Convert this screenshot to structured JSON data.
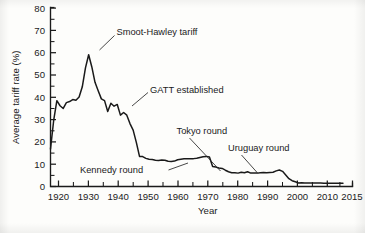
{
  "chart_data": {
    "type": "line",
    "title": "",
    "xlabel": "Year",
    "ylabel": "Average tariff rate (%)",
    "xlim": [
      1920,
      2015
    ],
    "ylim": [
      0,
      80
    ],
    "grid": false,
    "legend": "none",
    "x_ticks": [
      1920,
      1930,
      1940,
      1950,
      1960,
      1970,
      1980,
      1990,
      2000,
      2010,
      2015
    ],
    "x_tick_labels": [
      "1920",
      "1930",
      "1940",
      "1950",
      "1960",
      "1970",
      "1980",
      "1990",
      "2000",
      "2010",
      "2015"
    ],
    "x_minor_ticks": [
      1925,
      1935,
      1945,
      1955,
      1965,
      1975,
      1985,
      1995,
      2005
    ],
    "y_ticks": [
      0,
      10,
      20,
      30,
      40,
      50,
      60,
      70,
      80
    ],
    "y_tick_labels": [
      "0",
      "10",
      "20",
      "30",
      "40",
      "50",
      "60",
      "70",
      "80"
    ],
    "y_minor_ticks": [
      5,
      15,
      25,
      35,
      45,
      55,
      65,
      75
    ],
    "series": [
      {
        "name": "Average tariff rate",
        "units": "%",
        "x": [
          1920,
          1921,
          1922,
          1923,
          1924,
          1925,
          1926,
          1927,
          1928,
          1929,
          1930,
          1931,
          1932,
          1933,
          1934,
          1935,
          1936,
          1937,
          1938,
          1939,
          1940,
          1941,
          1942,
          1943,
          1944,
          1945,
          1946,
          1947,
          1948,
          1949,
          1950,
          1951,
          1952,
          1953,
          1954,
          1955,
          1956,
          1957,
          1958,
          1959,
          1960,
          1961,
          1962,
          1963,
          1964,
          1965,
          1966,
          1967,
          1968,
          1969,
          1970,
          1971,
          1972,
          1973,
          1974,
          1975,
          1976,
          1977,
          1978,
          1979,
          1980,
          1981,
          1982,
          1983,
          1984,
          1985,
          1986,
          1987,
          1988,
          1989,
          1990,
          1991,
          1992,
          1993,
          1994,
          1995,
          1996,
          1997,
          1998,
          1999,
          2000,
          2001,
          2002,
          2003,
          2004,
          2005,
          2006,
          2007,
          2008,
          2009,
          2010,
          2011,
          2012
        ],
        "y": [
          16.8,
          29.6,
          38.5,
          36.2,
          35.0,
          37.6,
          38.1,
          39.0,
          38.7,
          40.1,
          44.7,
          53.2,
          59.1,
          53.6,
          46.7,
          42.9,
          39.3,
          38.5,
          33.6,
          37.3,
          36.0,
          36.8,
          32.0,
          33.2,
          32.0,
          28.2,
          25.3,
          19.8,
          13.5,
          13.4,
          12.6,
          12.2,
          12.1,
          11.8,
          11.7,
          11.9,
          11.8,
          11.3,
          11.2,
          11.4,
          12.0,
          12.2,
          12.4,
          12.4,
          12.5,
          12.5,
          12.7,
          13.0,
          13.3,
          13.5,
          13.2,
          9.0,
          8.7,
          8.3,
          8.1,
          7.3,
          6.6,
          6.2,
          6.2,
          6.0,
          6.4,
          6.2,
          6.6,
          6.0,
          6.1,
          6.0,
          6.2,
          6.3,
          6.2,
          6.3,
          6.4,
          7.0,
          7.4,
          6.8,
          5.2,
          3.5,
          2.6,
          2.1,
          1.6,
          1.7,
          1.6,
          1.6,
          1.6,
          1.6,
          1.6,
          1.6,
          1.5,
          1.5,
          1.5,
          1.5,
          1.5,
          1.5,
          1.5
        ]
      }
    ],
    "annotations": [
      {
        "id": "smoot-hawley",
        "label": "Smoot-Hawley tariff",
        "points_to_year": 1932,
        "points_to_value": 58
      },
      {
        "id": "gatt",
        "label": "GATT established",
        "points_to_year": 1947,
        "points_to_value": 32
      },
      {
        "id": "kennedy-round",
        "label": "Kennedy round",
        "points_to_year": 1967,
        "points_to_value": 13
      },
      {
        "id": "tokyo-round",
        "label": "Tokyo round",
        "points_to_year": 1979,
        "points_to_value": 6
      },
      {
        "id": "uruguay-round",
        "label": "Uruguay round",
        "points_to_year": 1994,
        "points_to_value": 5
      }
    ],
    "colors": {
      "line": "#1a1a1a",
      "axis": "#1b1b1b",
      "background": "#fdfdfb"
    }
  }
}
